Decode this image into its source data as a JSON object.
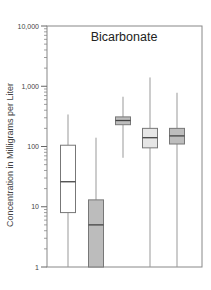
{
  "chart_data": {
    "type": "box",
    "title": "Bicarbonate",
    "xlabel": "",
    "ylabel": "Concentration in Milligrams per Liter",
    "yscale": "log",
    "ylim": [
      1,
      10000
    ],
    "y_ticks": [
      {
        "value": 1,
        "label": "1"
      },
      {
        "value": 10,
        "label": "10"
      },
      {
        "value": 100,
        "label": "100"
      },
      {
        "value": 1000,
        "label": "1,000"
      },
      {
        "value": 10000,
        "label": "10,000"
      }
    ],
    "grid": false,
    "legend": null,
    "boxes": [
      {
        "index": 1,
        "whisker_high": 340,
        "q3": 105,
        "median": 26,
        "q1": 8,
        "whisker_low": 1,
        "fill": "#ffffff"
      },
      {
        "index": 2,
        "whisker_high": 140,
        "q3": 13,
        "median": 5,
        "q1": 1,
        "whisker_low": 1,
        "fill": "#bcbcbc"
      },
      {
        "index": 3,
        "whisker_high": 670,
        "q3": 310,
        "median": 270,
        "q1": 230,
        "whisker_low": 65,
        "fill": "#bdbdbd"
      },
      {
        "index": 4,
        "whisker_high": 1400,
        "q3": 200,
        "median": 140,
        "q1": 95,
        "whisker_low": 1,
        "fill": "#e6e6e6"
      },
      {
        "index": 5,
        "whisker_high": 780,
        "q3": 200,
        "median": 150,
        "q1": 110,
        "whisker_low": 1,
        "fill": "#bdbdbd"
      }
    ]
  },
  "labels": {
    "title": "Bicarbonate",
    "ylabel": "Concentration in Milligrams per Liter"
  }
}
